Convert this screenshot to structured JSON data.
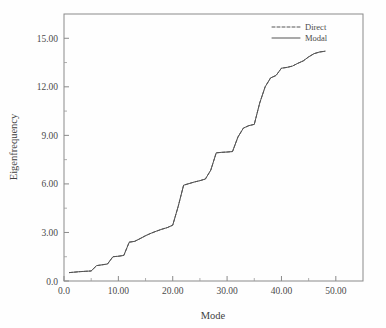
{
  "chart_data": {
    "type": "line",
    "title": "",
    "xlabel": "Mode",
    "ylabel": "Eigenfrequency",
    "xlim": [
      0,
      55
    ],
    "ylim": [
      0,
      16.5
    ],
    "grid": false,
    "legend_position": "top-right",
    "xticks": [
      0,
      10,
      20,
      30,
      40,
      50
    ],
    "xtick_labels": [
      "0.0",
      "10.00",
      "20.00",
      "30.00",
      "40.00",
      "50.00"
    ],
    "yticks": [
      0,
      3,
      6,
      9,
      12,
      15
    ],
    "ytick_labels": [
      "0.0",
      "3.00",
      "6.00",
      "9.00",
      "12.00",
      "15.00"
    ],
    "x": [
      1,
      2,
      3,
      4,
      5,
      6,
      7,
      8,
      9,
      10,
      11,
      12,
      13,
      14,
      15,
      16,
      17,
      18,
      19,
      20,
      21,
      22,
      23,
      24,
      25,
      26,
      27,
      28,
      29,
      30,
      31,
      32,
      33,
      34,
      35,
      36,
      37,
      38,
      39,
      40,
      41,
      42,
      43,
      44,
      45,
      46,
      47,
      48
    ],
    "series": [
      {
        "name": "Direct",
        "style": "dashed",
        "color": "#555555",
        "values": [
          0.52,
          0.55,
          0.58,
          0.6,
          0.62,
          0.95,
          1.0,
          1.05,
          1.5,
          1.53,
          1.58,
          2.4,
          2.45,
          2.62,
          2.8,
          2.95,
          3.08,
          3.2,
          3.3,
          3.45,
          4.6,
          5.92,
          6.02,
          6.12,
          6.2,
          6.3,
          6.85,
          7.92,
          7.95,
          7.97,
          8.0,
          8.9,
          9.45,
          9.6,
          9.68,
          11.0,
          12.0,
          12.55,
          12.7,
          13.15,
          13.2,
          13.28,
          13.45,
          13.6,
          13.85,
          14.05,
          14.15,
          14.2
        ]
      },
      {
        "name": "Modal",
        "style": "solid",
        "color": "#555555",
        "values": [
          0.52,
          0.55,
          0.58,
          0.6,
          0.62,
          0.95,
          1.0,
          1.05,
          1.5,
          1.53,
          1.58,
          2.4,
          2.45,
          2.62,
          2.8,
          2.95,
          3.08,
          3.2,
          3.3,
          3.45,
          4.6,
          5.92,
          6.02,
          6.12,
          6.2,
          6.3,
          6.85,
          7.92,
          7.95,
          7.97,
          8.0,
          8.9,
          9.45,
          9.6,
          9.68,
          11.0,
          12.0,
          12.55,
          12.7,
          13.15,
          13.2,
          13.28,
          13.45,
          13.6,
          13.85,
          14.05,
          14.15,
          14.2
        ]
      }
    ]
  },
  "legend": {
    "entries": [
      {
        "label": "Direct"
      },
      {
        "label": "Modal"
      }
    ]
  }
}
